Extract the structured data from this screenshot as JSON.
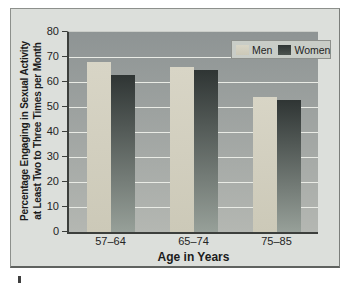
{
  "chart_data": {
    "type": "bar",
    "categories": [
      "57–64",
      "65–74",
      "75–85"
    ],
    "series": [
      {
        "name": "Men",
        "values": [
          68,
          66,
          54
        ]
      },
      {
        "name": "Women",
        "values": [
          63,
          65,
          53
        ]
      }
    ],
    "xlabel": "Age in Years",
    "ylabel_line1": "Percentage Engaging in Sexual Activity",
    "ylabel_line2": "at Least Two to Three Times per Month",
    "ylim": [
      0,
      80
    ],
    "yticks": [
      0,
      10,
      20,
      30,
      40,
      50,
      60,
      70,
      80
    ],
    "grid": true,
    "legend_position": "top-right",
    "colors": {
      "men_bar_top": "#d8d5c6",
      "men_bar_bottom": "#ccc9b8",
      "women_bar_top": "#2f3534",
      "women_bar_bottom": "#97a099",
      "plot_bg_top": "#8e9494",
      "plot_bg_bottom": "#b4b7b2",
      "gridline": "#e9ebe5",
      "figure_bg": "#dcdfdb",
      "legend_bg": "#c9cdc7",
      "axis_line": "#3c3f3c",
      "text": "#1f1f1f"
    }
  }
}
